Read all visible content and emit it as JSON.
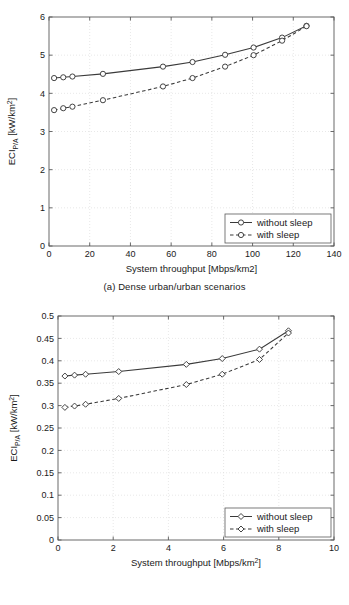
{
  "figure": {
    "panels": [
      {
        "id": "a",
        "caption": "(a) Dense urban/urban scenarios",
        "chart_data": {
          "type": "line",
          "title": "",
          "xlabel": "System throughput [Mbps/km2]",
          "ylabel": "ECI",
          "ylabel_sub": "P/A",
          "ylabel_unit": " [kW/km",
          "ylabel_sup": "2",
          "ylabel_close": "]",
          "xlim": [
            0,
            140
          ],
          "ylim": [
            0,
            6
          ],
          "xticks": [
            0,
            20,
            40,
            60,
            80,
            100,
            120,
            140
          ],
          "yticks": [
            0,
            1,
            2,
            3,
            4,
            5,
            6
          ],
          "xticklabels": [
            "0",
            "20",
            "40",
            "60",
            "80",
            "100",
            "120",
            "140"
          ],
          "yticklabels": [
            "0",
            "1",
            "2",
            "3",
            "4",
            "5",
            "6"
          ],
          "grid": true,
          "legend_position": "lower right",
          "marker": "circle",
          "series": [
            {
              "name": "without sleep",
              "style": "solid",
              "x": [
                2.5,
                7.0,
                11.5,
                26.5,
                56.0,
                70.5,
                86.5,
                100.5,
                114.5,
                126.5
              ],
              "y": [
                4.4,
                4.42,
                4.44,
                4.51,
                4.7,
                4.82,
                5.01,
                5.2,
                5.46,
                5.77
              ]
            },
            {
              "name": "with sleep",
              "style": "dashed",
              "x": [
                2.5,
                7.0,
                11.5,
                26.5,
                56.0,
                70.5,
                86.5,
                100.5,
                114.5,
                126.5
              ],
              "y": [
                3.56,
                3.61,
                3.65,
                3.82,
                4.18,
                4.4,
                4.7,
                5.0,
                5.38,
                5.76
              ]
            }
          ]
        }
      },
      {
        "id": "b",
        "caption": "(b) Suburban/rural scenarios",
        "chart_data": {
          "type": "line",
          "title": "",
          "xlabel_main": "System throughput [Mbps/km",
          "xlabel_sup": "2",
          "xlabel_close": "]",
          "ylabel": "ECI",
          "ylabel_sub": "P/A",
          "ylabel_unit": " [kW/km",
          "ylabel_sup": "2",
          "ylabel_close": "]",
          "xlim": [
            0,
            10
          ],
          "ylim": [
            0,
            0.5
          ],
          "xticks": [
            0,
            2,
            4,
            6,
            8,
            10
          ],
          "yticks": [
            0,
            0.05,
            0.1,
            0.15,
            0.2,
            0.25,
            0.3,
            0.35,
            0.4,
            0.45,
            0.5
          ],
          "xticklabels": [
            "0",
            "2",
            "4",
            "6",
            "8",
            "10"
          ],
          "yticklabels": [
            "0",
            "0.05",
            "0.1",
            "0.15",
            "0.2",
            "0.25",
            "0.3",
            "0.35",
            "0.4",
            "0.45",
            "0.5"
          ],
          "grid": true,
          "legend_position": "lower right",
          "marker": "diamond",
          "series": [
            {
              "name": "without sleep",
              "style": "solid",
              "x": [
                0.25,
                0.6,
                1.0,
                2.2,
                4.65,
                5.95,
                7.3,
                8.35
              ],
              "y": [
                0.366,
                0.368,
                0.37,
                0.376,
                0.392,
                0.405,
                0.426,
                0.467
              ]
            },
            {
              "name": "with sleep",
              "style": "dashed",
              "x": [
                0.25,
                0.6,
                1.0,
                2.2,
                4.65,
                5.95,
                7.3,
                8.35
              ],
              "y": [
                0.296,
                0.299,
                0.303,
                0.316,
                0.347,
                0.37,
                0.403,
                0.462
              ]
            }
          ]
        }
      }
    ]
  },
  "colors": {
    "line": "#3a3a3a",
    "frame": "#5a5a5a",
    "grid": "#d8d8d8",
    "background": "#ffffff"
  }
}
